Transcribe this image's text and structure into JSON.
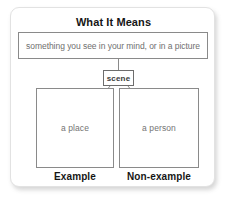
{
  "card": {
    "title": "What It Means",
    "definition": "something you see in your mind, or in a picture",
    "term": "scene",
    "boxes": [
      {
        "content": "a place",
        "caption": "Example"
      },
      {
        "content": "a person",
        "caption": "Non-example"
      }
    ],
    "colors": {
      "background": "#ffffff",
      "card_border": "#e2e2e2",
      "box_border": "#8a8a8a",
      "heading_text": "#161616",
      "body_text": "#6f6f6f",
      "term_text": "#3b3b3b",
      "connector_line": "#8a8a8a"
    }
  }
}
